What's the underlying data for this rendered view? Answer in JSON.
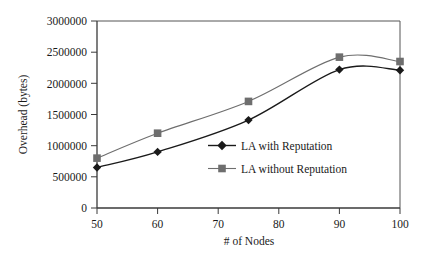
{
  "chart_data": {
    "type": "line",
    "title": "",
    "xlabel": "# of Nodes",
    "ylabel": "Overhead (bytes)",
    "x": [
      50,
      60,
      75,
      90,
      100
    ],
    "xlim": [
      50,
      100
    ],
    "ylim": [
      0,
      3000000
    ],
    "xticks": [
      50,
      60,
      70,
      80,
      90,
      100
    ],
    "xtick_labels": [
      "50",
      "60",
      "70",
      "80",
      "90",
      "100"
    ],
    "yticks": [
      0,
      500000,
      1000000,
      1500000,
      2000000,
      2500000,
      3000000
    ],
    "ytick_labels": [
      "0",
      "500000",
      "1000000",
      "1500000",
      "2000000",
      "2500000",
      "3000000"
    ],
    "grid": false,
    "legend_position": "center-right-inside",
    "series": [
      {
        "name": "LA with Reputation",
        "marker": "diamond",
        "color": "#1a1a1a",
        "values": [
          650000,
          900000,
          1410000,
          2220000,
          2210000
        ]
      },
      {
        "name": "LA without Reputation",
        "marker": "square",
        "color": "#6e6e6e",
        "values": [
          800000,
          1200000,
          1710000,
          2420000,
          2350000
        ]
      }
    ]
  },
  "legend": {
    "items": [
      {
        "label": "LA with Reputation",
        "marker": "diamond",
        "color": "#1a1a1a"
      },
      {
        "label": "LA without Reputation",
        "marker": "square",
        "color": "#6e6e6e"
      }
    ]
  },
  "axes": {
    "y_title": "Overhead (bytes)",
    "x_title": "# of Nodes"
  }
}
